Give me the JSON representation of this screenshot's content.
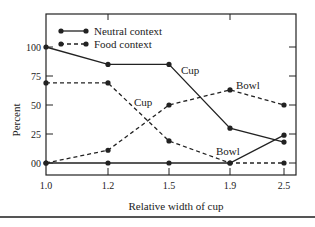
{
  "chart_data": {
    "type": "line",
    "title": "",
    "xlabel": "Relative width of cup",
    "ylabel": "Percent",
    "x": [
      "1.0",
      "1.2",
      "1.5",
      "1.9",
      "2.5"
    ],
    "yticks": [
      "00",
      "25",
      "50",
      "75",
      "100"
    ],
    "ylim": [
      0,
      100
    ],
    "grid": false,
    "legend_position": "upper-left-inside",
    "legend": [
      {
        "name": "Neutral context",
        "style": "solid"
      },
      {
        "name": "Food context",
        "style": "dashed"
      }
    ],
    "series": [
      {
        "name": "Neutral context - Cup",
        "context": "Neutral context",
        "response": "Cup",
        "style": "solid",
        "values": [
          100,
          85,
          85,
          30,
          18
        ]
      },
      {
        "name": "Neutral context - Bowl",
        "context": "Neutral context",
        "response": "Bowl",
        "style": "solid",
        "values": [
          0,
          0,
          0,
          0,
          24
        ]
      },
      {
        "name": "Food context - Cup",
        "context": "Food context",
        "response": "Cup",
        "style": "dashed",
        "values": [
          69,
          69,
          19,
          0,
          0
        ]
      },
      {
        "name": "Food context - Bowl",
        "context": "Food context",
        "response": "Bowl",
        "style": "dashed",
        "values": [
          0,
          11,
          50,
          63,
          50
        ]
      }
    ],
    "annotations": [
      {
        "text": "Cup",
        "near": "Neutral context - Cup at 1.5"
      },
      {
        "text": "Bowl",
        "near": "Food context - Bowl at 1.9"
      },
      {
        "text": "Cup",
        "near": "Food context - Cup between 1.2 and 1.5"
      },
      {
        "text": "Bowl",
        "near": "Neutral context - Bowl at 1.9"
      }
    ]
  },
  "labels": {
    "legend_neutral": "Neutral context",
    "legend_food": "Food context",
    "xlabel": "Relative width of cup",
    "ylabel": "Percent",
    "ann_cup_1": "Cup",
    "ann_bowl_1": "Bowl",
    "ann_cup_2": "Cup",
    "ann_bowl_2": "Bowl"
  },
  "ticks": {
    "x": [
      "1.0",
      "1.2",
      "1.5",
      "1.9",
      "2.5"
    ],
    "y": [
      "00",
      "25",
      "50",
      "75",
      "100"
    ]
  }
}
